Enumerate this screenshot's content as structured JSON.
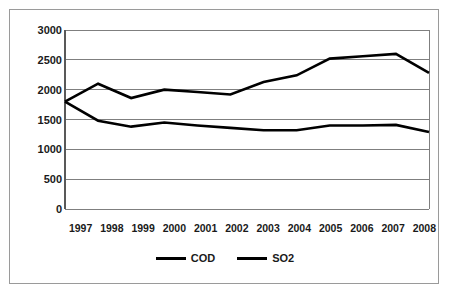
{
  "chart_data": {
    "type": "line",
    "title": "",
    "subtitle": "",
    "xlabel": "",
    "ylabel": "",
    "categories": [
      "1997",
      "1998",
      "1999",
      "2000",
      "2001",
      "2002",
      "2003",
      "2004",
      "2005",
      "2006",
      "2007",
      "2008"
    ],
    "series": [
      {
        "name": "COD",
        "color": "#000000",
        "values": [
          1800,
          2100,
          1860,
          2000,
          1960,
          1920,
          2130,
          2240,
          2520,
          2560,
          2600,
          2280
        ]
      },
      {
        "name": "SO2",
        "color": "#000000",
        "values": [
          1800,
          1480,
          1380,
          1450,
          1400,
          1360,
          1320,
          1320,
          1400,
          1400,
          1410,
          1290
        ]
      }
    ],
    "ylim": [
      0,
      3000
    ],
    "yticks": [
      0,
      500,
      1000,
      1500,
      2000,
      2500,
      3000
    ],
    "ytick_labels": [
      "0",
      "500",
      "1000",
      "1500",
      "2000",
      "2500",
      "3000"
    ],
    "grid": "horizontal",
    "legend_position": "bottom",
    "annotations": []
  },
  "legend": {
    "items": [
      {
        "label": "COD",
        "marker": "line-swatch"
      },
      {
        "label": "SO2",
        "marker": "line-swatch"
      }
    ]
  },
  "style": {
    "line_color": "#000000",
    "grid_color": "#7f7f7f",
    "axis_color": "#595959",
    "border_color": "#9a9a9a",
    "background": "#ffffff",
    "text_color": "#1a1a1a"
  }
}
